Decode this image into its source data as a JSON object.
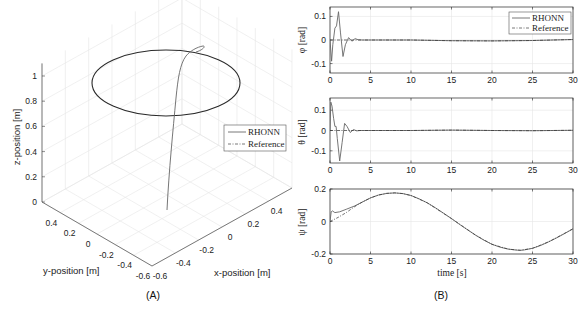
{
  "chart_data": [
    {
      "panel": "(A)",
      "type": "line3d",
      "title": "",
      "xlabel": "x-position [m]",
      "ylabel": "y-position [m]",
      "zlabel": "z-position [m]",
      "xticks": [
        "-0.6",
        "-0.4",
        "-0.2",
        "0",
        "0.2",
        "0.4"
      ],
      "yticks": [
        "0.4",
        "0.2",
        "0",
        "-0.2",
        "-0.4",
        "-0.6"
      ],
      "zticks": [
        "0",
        "0.2",
        "0.4",
        "0.6",
        "0.8",
        "1"
      ],
      "xlim": [
        -0.6,
        0.6
      ],
      "ylim": [
        -0.6,
        0.6
      ],
      "zlim": [
        0,
        1.1
      ],
      "grid": true,
      "legend": {
        "position": "east",
        "entries": [
          "RHONN",
          "Reference"
        ]
      },
      "series": [
        {
          "name": "RHONN",
          "style": "solid",
          "description": "rises vertically from origin to z≈1, then converges onto circular reference path",
          "points": [
            [
              0,
              0,
              0
            ],
            [
              0.02,
              0.02,
              0.3
            ],
            [
              0.05,
              0.03,
              0.6
            ],
            [
              0.1,
              0.05,
              0.9
            ],
            [
              0.3,
              0.1,
              1.05
            ],
            [
              0.45,
              0.05,
              1.1
            ],
            [
              0.4,
              0,
              1.05
            ],
            [
              0.35,
              0,
              1.0
            ]
          ]
        },
        {
          "name": "Reference",
          "style": "dash-dot",
          "description": "circle of radius 0.5 m at z = 1 m",
          "center": [
            0,
            0,
            1
          ],
          "radius": 0.5
        }
      ]
    },
    {
      "panel": "(B)",
      "type": "line",
      "subplots": [
        {
          "ylabel": "φ [rad]",
          "ylim": [
            -0.14,
            0.14
          ],
          "yticks": [
            "0.1",
            "0",
            "-0.1"
          ],
          "xticks": [
            "0",
            "5",
            "10",
            "15",
            "20",
            "25",
            "30"
          ],
          "xlim": [
            0,
            30
          ],
          "legend": {
            "position": "northeast",
            "entries": [
              "RHONN",
              "Reference"
            ]
          },
          "series": [
            {
              "name": "RHONN",
              "x": [
                0,
                0.2,
                0.35,
                0.6,
                0.8,
                1.05,
                1.3,
                1.6,
                1.9,
                2.3,
                2.7,
                3.1,
                3.5,
                4,
                10,
                15,
                20,
                25,
                30
              ],
              "y": [
                0,
                -0.09,
                -0.02,
                0.05,
                0.06,
                0.12,
                0.03,
                -0.07,
                -0.02,
                0.01,
                -0.005,
                0.006,
                0.001,
                0,
                0,
                -0.003,
                -0.004,
                -0.002,
                0.002
              ]
            },
            {
              "name": "Reference",
              "x": [
                0,
                5,
                10,
                15,
                20,
                25,
                30
              ],
              "y": [
                0,
                0,
                0,
                -0.003,
                -0.004,
                -0.002,
                0.002
              ]
            }
          ]
        },
        {
          "ylabel": "θ [rad]",
          "ylim": [
            -0.16,
            0.16
          ],
          "yticks": [
            "0.1",
            "0",
            "-0.1"
          ],
          "xticks": [
            "0",
            "5",
            "10",
            "15",
            "20",
            "25",
            "30"
          ],
          "xlim": [
            0,
            30
          ],
          "series": [
            {
              "name": "RHONN",
              "x": [
                0,
                0.1,
                0.25,
                0.45,
                0.6,
                0.75,
                0.9,
                1.2,
                1.5,
                1.8,
                2.1,
                2.5,
                2.9,
                3.3,
                3.7,
                10,
                15,
                20,
                25,
                30
              ],
              "y": [
                0,
                0.14,
                0.12,
                0.06,
                0.02,
                0.02,
                -0.04,
                -0.15,
                -0.06,
                0.035,
                0.02,
                -0.01,
                0.005,
                -0.002,
                0,
                0,
                0.002,
                0,
                -0.001,
                0.001
              ]
            },
            {
              "name": "Reference",
              "x": [
                0,
                5,
                10,
                15,
                20,
                25,
                30
              ],
              "y": [
                0,
                0,
                0,
                0.002,
                0,
                -0.001,
                0.001
              ]
            }
          ]
        },
        {
          "ylabel": "ψ [rad]",
          "ylim": [
            -0.2,
            0.2
          ],
          "yticks": [
            "0.2",
            "0",
            "-0.2"
          ],
          "xticks": [
            "0",
            "5",
            "10",
            "15",
            "20",
            "25",
            "30"
          ],
          "xlim": [
            0,
            30
          ],
          "xlabel": "time [s]",
          "series": [
            {
              "name": "RHONN",
              "x": [
                0,
                0.15,
                0.3,
                0.6,
                1.2,
                2,
                3,
                4,
                5,
                6,
                7,
                8,
                9,
                10,
                11,
                12,
                13,
                14,
                15,
                16,
                17,
                18,
                19,
                20,
                21,
                22,
                23,
                23.5,
                24,
                25,
                26,
                27,
                28,
                29,
                30
              ],
              "y": [
                0,
                0.06,
                0.065,
                0.055,
                0.06,
                0.075,
                0.095,
                0.12,
                0.145,
                0.163,
                0.173,
                0.176,
                0.172,
                0.16,
                0.14,
                0.115,
                0.085,
                0.052,
                0.018,
                -0.018,
                -0.052,
                -0.085,
                -0.115,
                -0.14,
                -0.158,
                -0.17,
                -0.176,
                -0.177,
                -0.175,
                -0.165,
                -0.148,
                -0.125,
                -0.1,
                -0.073,
                -0.045
              ]
            },
            {
              "name": "Reference",
              "x": [
                0,
                1,
                2,
                3,
                4,
                5,
                6,
                7,
                8,
                9,
                10,
                12,
                15,
                18,
                20,
                22,
                23.5,
                25,
                27,
                30
              ],
              "y": [
                0,
                0.025,
                0.055,
                0.09,
                0.12,
                0.145,
                0.163,
                0.173,
                0.176,
                0.172,
                0.16,
                0.115,
                0.018,
                -0.085,
                -0.14,
                -0.17,
                -0.177,
                -0.165,
                -0.125,
                -0.045
              ]
            }
          ]
        }
      ]
    }
  ],
  "labels": {
    "panel_a": "(A)",
    "panel_b": "(B)",
    "legend_rhonn": "RHONN",
    "legend_reference": "Reference",
    "x_position": "x-position [m]",
    "y_position": "y-position [m]",
    "z_position": "z-position [m]",
    "time": "time [s]",
    "phi": "φ [rad]",
    "theta": "θ [rad]",
    "psi": "ψ [rad]"
  }
}
